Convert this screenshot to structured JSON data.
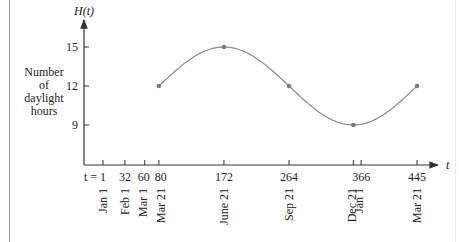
{
  "chart_data": {
    "type": "line",
    "title": "",
    "xlabel": "t",
    "ylabel": "H(t)",
    "ylabel_side": [
      "Number",
      "of",
      "daylight",
      "hours"
    ],
    "x_ticks": [
      {
        "value": 1,
        "label": "t = 1",
        "date": [
          "Jan 1"
        ]
      },
      {
        "value": 32,
        "label": "32",
        "date": [
          "Feb 1"
        ]
      },
      {
        "value": 60,
        "label": "60",
        "date": [
          "Mar 1"
        ]
      },
      {
        "value": 80,
        "label": "80",
        "date": [
          "Mar 21"
        ]
      },
      {
        "value": 172,
        "label": "172",
        "date": [
          "June 21"
        ]
      },
      {
        "value": 264,
        "label": "264",
        "date": [
          "Sep 21"
        ]
      },
      {
        "value": 355,
        "label": "",
        "date": [
          "Dec 21"
        ]
      },
      {
        "value": 366,
        "label": "366",
        "date": [
          "Jan 1"
        ]
      },
      {
        "value": 445,
        "label": "445",
        "date": [
          "Mar 21"
        ]
      }
    ],
    "y_ticks": [
      9,
      12,
      15
    ],
    "x": [
      80,
      172,
      264,
      355,
      445
    ],
    "series": [
      {
        "name": "H(t)",
        "values": [
          12,
          15,
          12,
          9,
          12
        ]
      }
    ],
    "curve": "sinusoid",
    "xlim": [
      0,
      460
    ],
    "ylim": [
      6,
      17
    ],
    "grid": false,
    "legend": null,
    "colors": {
      "curve": "#8a8a8a",
      "points": "#7a7a7a",
      "axis": "#333333"
    }
  }
}
